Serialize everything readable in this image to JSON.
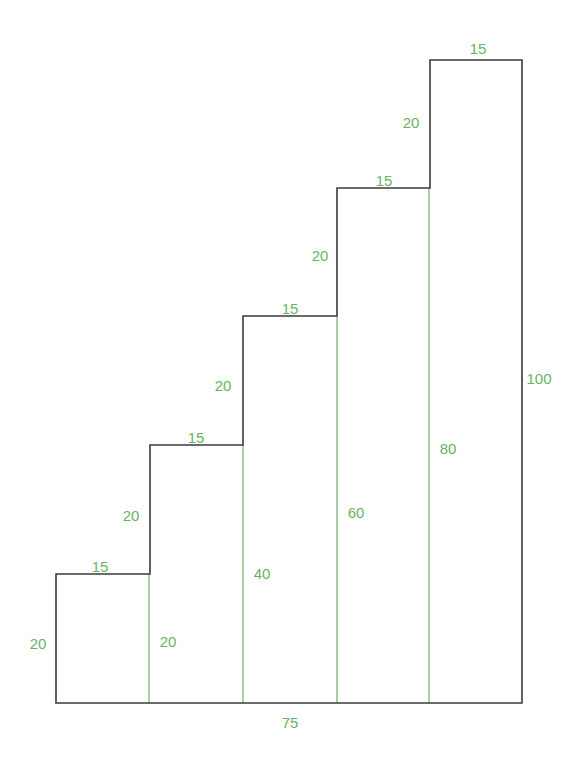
{
  "figure": {
    "outline_color": "#3b3b3b",
    "dimension_color": "#69b365",
    "background_color": "#ffffff",
    "outline_width": 1.6,
    "interior_line_width": 1.2
  },
  "chart_data": {
    "type": "diagram",
    "xlabel": "",
    "ylabel": "",
    "total_run": 75,
    "total_rise": 100,
    "step_count": 5,
    "tread_depth": 15,
    "riser_height": 20,
    "cumulative_heights": [
      20,
      40,
      60,
      80,
      100
    ],
    "treads": [
      15,
      15,
      15,
      15,
      15
    ],
    "risers": [
      20,
      20,
      20,
      20,
      20
    ]
  },
  "geometry": {
    "baseline_y": 703,
    "left_x": 56,
    "right_x": 522,
    "step_xs": [
      56,
      150,
      243,
      337,
      430,
      522
    ],
    "step_tops": [
      574,
      445,
      316,
      188,
      60
    ],
    "interior_verticals": [
      149,
      243,
      337,
      429
    ]
  },
  "labels": {
    "treads": [
      {
        "text": "15",
        "x": 100,
        "y": 566
      },
      {
        "text": "15",
        "x": 196,
        "y": 437
      },
      {
        "text": "15",
        "x": 290,
        "y": 308
      },
      {
        "text": "15",
        "x": 384,
        "y": 180
      },
      {
        "text": "15",
        "x": 478,
        "y": 48
      }
    ],
    "risers": [
      {
        "text": "20",
        "x": 131,
        "y": 515
      },
      {
        "text": "20",
        "x": 223,
        "y": 385
      },
      {
        "text": "20",
        "x": 320,
        "y": 255
      },
      {
        "text": "20",
        "x": 411,
        "y": 122
      }
    ],
    "heights": [
      {
        "text": "20",
        "x": 38,
        "y": 643
      },
      {
        "text": "20",
        "x": 168,
        "y": 641
      },
      {
        "text": "40",
        "x": 262,
        "y": 573
      },
      {
        "text": "60",
        "x": 356,
        "y": 512
      },
      {
        "text": "80",
        "x": 448,
        "y": 448
      },
      {
        "text": "100",
        "x": 539,
        "y": 378
      }
    ],
    "base": {
      "text": "75",
      "x": 290,
      "y": 722
    }
  }
}
